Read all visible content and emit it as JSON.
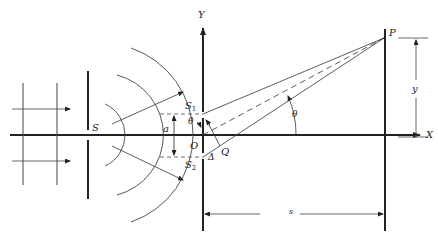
{
  "figure": {
    "labels": {
      "source": "S",
      "slit1": "S",
      "slit1_sub": "1",
      "slit2": "S",
      "slit2_sub": "2",
      "origin": "O",
      "foot_point": "Q",
      "slit_separation": "a",
      "path_difference": "Δ",
      "angle_at_slits": "θ",
      "angle_at_origin": "θ",
      "y_axis": "Y",
      "x_axis": "X",
      "point": "P",
      "height": "y",
      "distance": "s"
    },
    "colors": {
      "ink": "#222222",
      "background": "#ffffff"
    }
  }
}
